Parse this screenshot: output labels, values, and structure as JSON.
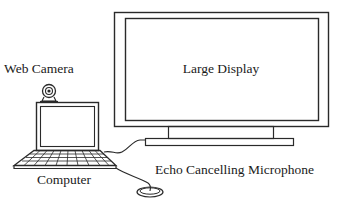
{
  "diagram": {
    "type": "equipment-setup",
    "labels": {
      "web_camera": "Web Camera",
      "large_display": "Large Display",
      "computer": "Computer",
      "microphone": "Echo Cancelling Microphone"
    },
    "components": [
      {
        "id": "large_display",
        "label": "Large Display",
        "icon": "monitor-icon"
      },
      {
        "id": "web_camera",
        "label": "Web Camera",
        "icon": "webcam-icon"
      },
      {
        "id": "computer",
        "label": "Computer",
        "icon": "laptop-icon"
      },
      {
        "id": "microphone",
        "label": "Echo Cancelling Microphone",
        "icon": "microphone-puck-icon"
      }
    ],
    "connections": [
      {
        "from": "computer",
        "to": "large_display"
      },
      {
        "from": "computer",
        "to": "microphone"
      }
    ],
    "colors": {
      "line": "#2a2a2a",
      "text": "#1a1a1a",
      "background": "#ffffff"
    }
  }
}
